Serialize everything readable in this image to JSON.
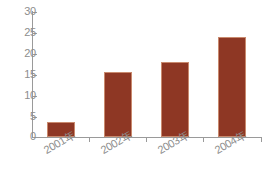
{
  "chart_data": {
    "type": "bar",
    "title": "",
    "subtitle": "",
    "xlabel": "",
    "ylabel": "",
    "categories": [
      "2001年",
      "2002年",
      "2003年",
      "2004年"
    ],
    "values": [
      3.5,
      15.6,
      18.1,
      24.0
    ],
    "ylim": [
      0,
      30
    ],
    "yticks": [
      0,
      5,
      10,
      15,
      20,
      25,
      30
    ],
    "ytick_labels": [
      "0",
      "5",
      "10",
      "15",
      "20",
      "25",
      "30"
    ],
    "grid": false,
    "legend": null,
    "legend_position": "none",
    "series": [
      {
        "name": "",
        "values": [
          3.5,
          15.6,
          18.1,
          24.0
        ]
      }
    ],
    "colors": {
      "bar_fill": "#8e3724",
      "bar_edge": "#c98a6e",
      "axis": "#9a9a9a",
      "tick_text": "#8d8d8d",
      "background": "#ffffff"
    },
    "annotations": []
  }
}
